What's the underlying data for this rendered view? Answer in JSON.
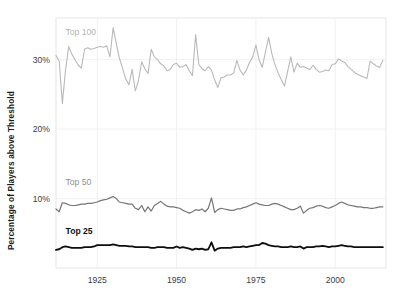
{
  "chart_data": {
    "type": "line",
    "title": "",
    "xlabel": "",
    "ylabel": "Percentage of Players above Threshold",
    "xlim": [
      1912,
      2016
    ],
    "ylim": [
      0,
      36
    ],
    "grid": true,
    "legend_position": "inline-left",
    "y_tick_labels": [
      "30%",
      "20%",
      "10%"
    ],
    "y_tick_values": [
      30,
      20,
      10
    ],
    "x_tick_labels": [
      "1925",
      "1950",
      "1975",
      "2000"
    ],
    "x_tick_values": [
      1925,
      1950,
      1975,
      2000
    ],
    "x": [
      1912,
      1913,
      1914,
      1915,
      1916,
      1917,
      1918,
      1919,
      1920,
      1921,
      1922,
      1923,
      1924,
      1925,
      1926,
      1927,
      1928,
      1929,
      1930,
      1931,
      1932,
      1933,
      1934,
      1935,
      1936,
      1937,
      1938,
      1939,
      1940,
      1941,
      1942,
      1943,
      1944,
      1945,
      1946,
      1947,
      1948,
      1949,
      1950,
      1951,
      1952,
      1953,
      1954,
      1955,
      1956,
      1957,
      1958,
      1959,
      1960,
      1961,
      1962,
      1963,
      1964,
      1965,
      1966,
      1967,
      1968,
      1969,
      1970,
      1971,
      1972,
      1973,
      1974,
      1975,
      1976,
      1977,
      1978,
      1979,
      1980,
      1981,
      1982,
      1983,
      1984,
      1985,
      1986,
      1987,
      1988,
      1989,
      1990,
      1991,
      1992,
      1993,
      1994,
      1995,
      1996,
      1997,
      1998,
      1999,
      2000,
      2001,
      2002,
      2003,
      2004,
      2005,
      2006,
      2007,
      2008,
      2009,
      2010,
      2011,
      2012,
      2013,
      2014,
      2015
    ],
    "series": [
      {
        "name": "Top 100",
        "color": "#b9b9b9",
        "width": 1.1,
        "label_x": 1915,
        "label_y": 33.6,
        "values": [
          30.6,
          29.8,
          23.7,
          28.5,
          31.9,
          30.8,
          30.0,
          29.2,
          28.8,
          31.5,
          31.7,
          31.5,
          31.6,
          31.8,
          31.9,
          31.8,
          32.0,
          30.4,
          34.6,
          32.3,
          30.2,
          28.7,
          27.2,
          26.4,
          28.6,
          25.5,
          27.0,
          29.7,
          28.7,
          28.0,
          31.5,
          30.4,
          30.0,
          29.4,
          29.1,
          28.4,
          28.6,
          29.3,
          29.5,
          28.9,
          29.0,
          29.3,
          28.4,
          27.7,
          33.6,
          29.3,
          28.7,
          28.4,
          29.0,
          28.5,
          27.1,
          26.0,
          27.4,
          27.5,
          27.8,
          27.8,
          28.1,
          29.9,
          28.5,
          27.8,
          28.5,
          29.6,
          30.4,
          32.1,
          30.0,
          28.9,
          31.1,
          33.2,
          30.9,
          29.3,
          28.1,
          27.1,
          26.2,
          28.3,
          30.4,
          28.2,
          29.5,
          28.9,
          29.0,
          28.8,
          28.6,
          29.2,
          28.6,
          28.2,
          28.3,
          28.5,
          28.4,
          29.3,
          29.4,
          30.1,
          29.8,
          29.6,
          29.0,
          28.6,
          28.2,
          27.9,
          27.7,
          27.5,
          27.3,
          29.8,
          29.4,
          29.1,
          28.9,
          29.9
        ]
      },
      {
        "name": "Top 50",
        "color": "#757575",
        "width": 1.2,
        "label_x": 1915,
        "label_y": 11.9,
        "values": [
          8.5,
          8.1,
          9.4,
          9.3,
          9.1,
          9.0,
          9.0,
          9.1,
          9.2,
          9.2,
          9.3,
          9.3,
          9.4,
          9.5,
          9.7,
          9.8,
          9.9,
          10.1,
          10.3,
          10.0,
          9.5,
          9.4,
          9.3,
          9.2,
          9.2,
          8.6,
          8.4,
          9.0,
          8.1,
          8.8,
          8.2,
          9.0,
          9.3,
          9.6,
          9.2,
          8.9,
          8.8,
          8.8,
          8.7,
          8.6,
          8.3,
          8.1,
          7.9,
          8.1,
          8.4,
          8.3,
          8.5,
          8.1,
          8.6,
          10.1,
          8.0,
          8.4,
          8.6,
          8.5,
          8.4,
          8.3,
          8.3,
          8.5,
          8.5,
          8.7,
          8.8,
          9.0,
          9.2,
          9.4,
          9.2,
          9.1,
          9.0,
          9.0,
          9.2,
          9.3,
          9.2,
          9.0,
          8.8,
          8.6,
          8.4,
          8.4,
          8.6,
          8.9,
          7.9,
          8.3,
          8.6,
          8.7,
          8.9,
          9.0,
          8.9,
          8.7,
          8.6,
          8.8,
          9.0,
          9.3,
          9.5,
          9.3,
          9.1,
          9.0,
          8.9,
          8.8,
          8.8,
          8.7,
          8.7,
          8.6,
          8.6,
          8.7,
          8.8,
          8.8
        ]
      },
      {
        "name": "Top 25",
        "color": "#0d0d0d",
        "width": 1.8,
        "label_x": 1915,
        "label_y": 4.9,
        "values": [
          2.6,
          2.7,
          3.0,
          3.1,
          3.0,
          2.9,
          2.9,
          2.9,
          2.9,
          3.0,
          3.0,
          3.0,
          3.1,
          3.3,
          3.3,
          3.3,
          3.3,
          3.3,
          3.4,
          3.3,
          3.2,
          3.2,
          3.2,
          3.1,
          3.1,
          3.0,
          3.0,
          3.0,
          3.0,
          3.0,
          2.9,
          2.9,
          3.0,
          3.0,
          3.0,
          2.9,
          2.9,
          2.9,
          3.1,
          2.9,
          3.0,
          2.9,
          2.8,
          2.6,
          2.8,
          2.7,
          2.8,
          2.6,
          2.7,
          3.7,
          2.5,
          2.8,
          2.9,
          2.9,
          2.9,
          2.9,
          3.0,
          3.0,
          3.0,
          3.1,
          3.0,
          3.1,
          3.2,
          3.3,
          3.3,
          3.6,
          3.5,
          3.3,
          3.2,
          3.1,
          3.1,
          3.0,
          3.0,
          3.0,
          3.1,
          3.0,
          3.0,
          3.1,
          2.8,
          3.0,
          3.0,
          3.0,
          3.1,
          3.1,
          3.2,
          3.1,
          3.0,
          3.1,
          3.1,
          3.2,
          3.3,
          3.2,
          3.1,
          3.1,
          3.0,
          3.0,
          3.0,
          3.0,
          3.0,
          3.0,
          3.0,
          3.0,
          3.0,
          3.0
        ]
      }
    ]
  },
  "plot": {
    "left": 56,
    "right": 386,
    "top": 18,
    "bottom": 268
  }
}
